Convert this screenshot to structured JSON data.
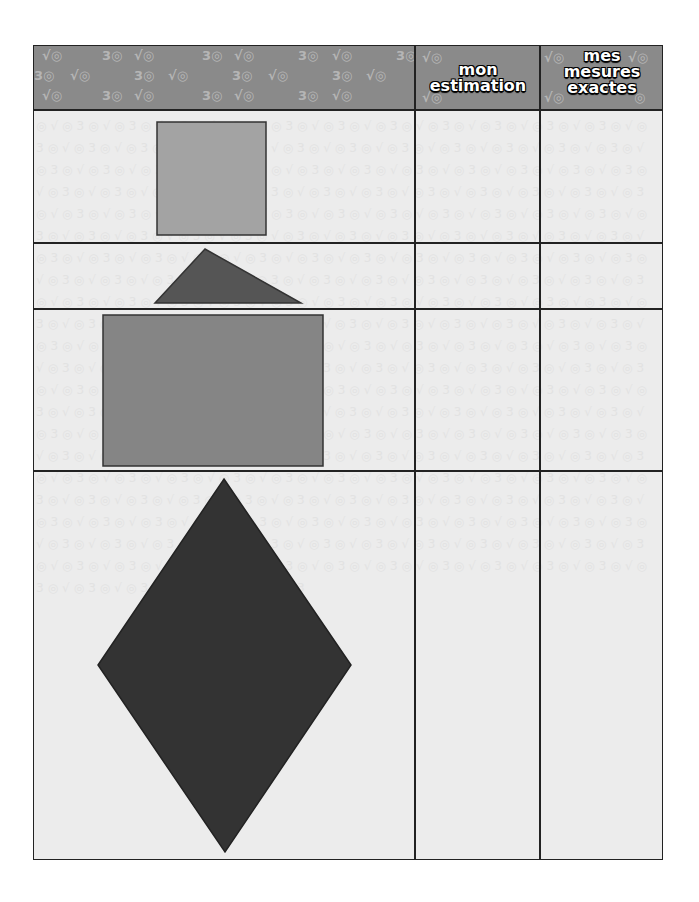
{
  "worksheet": {
    "header": {
      "columns": [
        {
          "label": ""
        },
        {
          "label_lines": [
            "mon",
            "estimation"
          ]
        },
        {
          "label_lines": [
            "mes",
            "mesures",
            "exactes"
          ]
        }
      ],
      "decoration_glyphs": [
        "3",
        "√"
      ]
    },
    "rows": [
      {
        "shape": "square",
        "fill": "#a3a3a3",
        "estimation": "",
        "exact": ""
      },
      {
        "shape": "triangle",
        "fill": "#555555",
        "estimation": "",
        "exact": ""
      },
      {
        "shape": "rectangle",
        "fill": "#858585",
        "estimation": "",
        "exact": ""
      },
      {
        "shape": "rhombus",
        "fill": "#333333",
        "estimation": "",
        "exact": ""
      }
    ],
    "colors": {
      "header_bg": "#8a8a8a",
      "sheet_bg": "#ececec",
      "grid_lines": "#222222"
    }
  }
}
